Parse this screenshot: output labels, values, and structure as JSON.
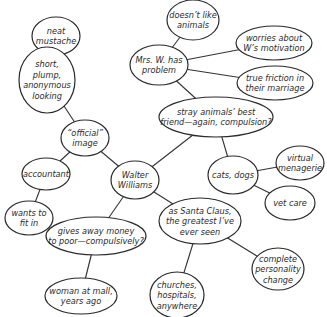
{
  "diagram": {
    "type": "mind-map",
    "colors": {
      "stroke": "#2a2a2a",
      "fill": "#ffffff",
      "text": "#2a2a2a"
    },
    "central_node": "walter",
    "nodes": [
      {
        "id": "mustache",
        "lines": [
          "neat",
          "mustache"
        ],
        "cx": 56,
        "cy": 36,
        "rx": 24,
        "ry": 19
      },
      {
        "id": "short",
        "lines": [
          "short,",
          "plump,",
          "anonymous",
          "looking"
        ],
        "cx": 47,
        "cy": 80,
        "rx": 28,
        "ry": 33
      },
      {
        "id": "official",
        "lines": [
          "“official”",
          "image"
        ],
        "cx": 85,
        "cy": 138,
        "rx": 24,
        "ry": 18
      },
      {
        "id": "accountant",
        "lines": [
          "accountant"
        ],
        "cx": 46,
        "cy": 174,
        "rx": 24,
        "ry": 16
      },
      {
        "id": "fitin",
        "lines": [
          "wants to",
          "fit in"
        ],
        "cx": 29,
        "cy": 218,
        "rx": 24,
        "ry": 17
      },
      {
        "id": "walter",
        "lines": [
          "Walter",
          "Williams"
        ],
        "cx": 135,
        "cy": 180,
        "rx": 24,
        "ry": 19
      },
      {
        "id": "money",
        "lines": [
          "gives away money",
          "to poor—compulsively?"
        ],
        "cx": 96,
        "cy": 236,
        "rx": 50,
        "ry": 19
      },
      {
        "id": "mall",
        "lines": [
          "woman at mall,",
          "years ago"
        ],
        "cx": 81,
        "cy": 296,
        "rx": 36,
        "ry": 18
      },
      {
        "id": "santa",
        "lines": [
          "as Santa Claus,",
          "the greatest I’ve",
          "ever seen"
        ],
        "cx": 200,
        "cy": 221,
        "rx": 41,
        "ry": 23
      },
      {
        "id": "churches",
        "lines": [
          "churches,",
          "hospitals,",
          "anywhere"
        ],
        "cx": 177,
        "cy": 295,
        "rx": 27,
        "ry": 23
      },
      {
        "id": "personality",
        "lines": [
          "complete",
          "personality",
          "change"
        ],
        "cx": 278,
        "cy": 269,
        "rx": 26,
        "ry": 21
      },
      {
        "id": "stray",
        "lines": [
          "stray animals’ best",
          "friend—again, compulsion?"
        ],
        "cx": 216,
        "cy": 117,
        "rx": 57,
        "ry": 20
      },
      {
        "id": "mrsw",
        "lines": [
          "Mrs. W. has",
          "problem"
        ],
        "cx": 159,
        "cy": 65,
        "rx": 29,
        "ry": 20
      },
      {
        "id": "dislike",
        "lines": [
          "doesn’t like",
          "animals"
        ],
        "cx": 193,
        "cy": 20,
        "rx": 26,
        "ry": 20
      },
      {
        "id": "worries",
        "lines": [
          "worries about",
          "W’s motivation"
        ],
        "cx": 274,
        "cy": 43,
        "rx": 38,
        "ry": 17
      },
      {
        "id": "friction",
        "lines": [
          "true friction in",
          "their marriage"
        ],
        "cx": 275,
        "cy": 83,
        "rx": 38,
        "ry": 17
      },
      {
        "id": "cats",
        "lines": [
          "cats, dogs"
        ],
        "cx": 233,
        "cy": 175,
        "rx": 25,
        "ry": 19
      },
      {
        "id": "menagerie",
        "lines": [
          "virtual",
          "menagerie"
        ],
        "cx": 300,
        "cy": 163,
        "rx": 24,
        "ry": 17
      },
      {
        "id": "vetcare",
        "lines": [
          "vet care"
        ],
        "cx": 290,
        "cy": 203,
        "rx": 25,
        "ry": 17
      }
    ],
    "edges": [
      [
        "mustache",
        "short"
      ],
      [
        "short",
        "official"
      ],
      [
        "official",
        "accountant"
      ],
      [
        "official",
        "walter"
      ],
      [
        "accountant",
        "fitin"
      ],
      [
        "walter",
        "stray"
      ],
      [
        "walter",
        "money"
      ],
      [
        "walter",
        "santa"
      ],
      [
        "money",
        "mall"
      ],
      [
        "santa",
        "churches"
      ],
      [
        "santa",
        "personality"
      ],
      [
        "stray",
        "mrsw"
      ],
      [
        "stray",
        "cats"
      ],
      [
        "mrsw",
        "dislike"
      ],
      [
        "mrsw",
        "worries"
      ],
      [
        "mrsw",
        "friction"
      ],
      [
        "cats",
        "menagerie"
      ],
      [
        "cats",
        "vetcare"
      ]
    ]
  }
}
